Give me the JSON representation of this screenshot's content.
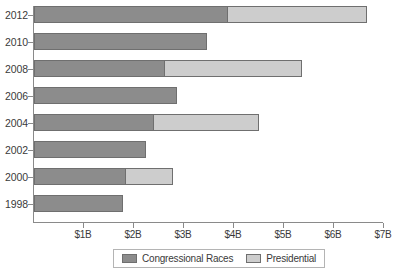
{
  "chart_data": {
    "type": "bar",
    "orientation": "horizontal",
    "stacked": true,
    "title": "",
    "subtitle": "",
    "xlabel": "",
    "ylabel": "",
    "xlim": [
      0,
      7
    ],
    "grid": false,
    "legend_position": "bottom",
    "unit": "billions of US dollars",
    "categories": [
      "2012",
      "2010",
      "2008",
      "2006",
      "2004",
      "2002",
      "2000",
      "1998"
    ],
    "x_tick_labels": [
      "$1B",
      "$2B",
      "$3B",
      "$4B",
      "$5B",
      "$6B",
      "$7B"
    ],
    "x_tick_values": [
      1,
      2,
      3,
      4,
      5,
      6,
      7
    ],
    "series": [
      {
        "name": "Congressional Races",
        "color": "#8c8c8c",
        "values": [
          3.88,
          3.46,
          2.62,
          2.85,
          2.4,
          2.24,
          1.84,
          1.78
        ]
      },
      {
        "name": "Presidential",
        "color": "#cdcdcd",
        "values": [
          2.78,
          0,
          2.74,
          0,
          2.1,
          0,
          0.94,
          0
        ]
      }
    ],
    "totals": [
      6.66,
      3.46,
      5.36,
      2.85,
      4.5,
      2.24,
      2.78,
      1.78
    ]
  },
  "legend": {
    "items": [
      {
        "label": "Congressional Races",
        "swatch": "dark-gray-swatch"
      },
      {
        "label": "Presidential",
        "swatch": "light-gray-swatch"
      }
    ]
  }
}
